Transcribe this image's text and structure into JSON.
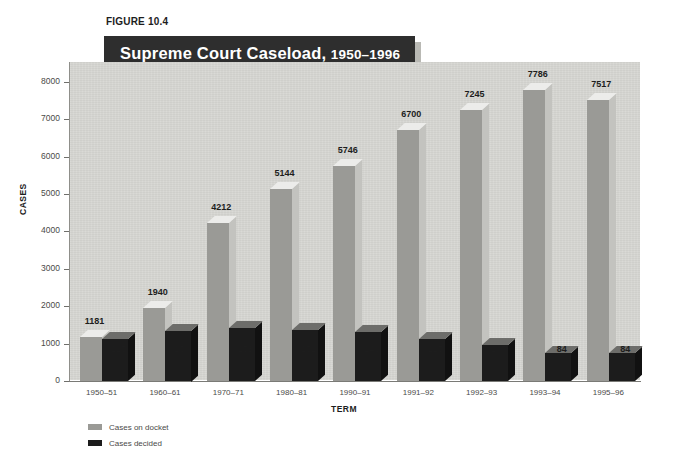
{
  "figure": {
    "label": "FIGURE 10.4",
    "title_main": "Supreme Court Caseload,",
    "title_years": "1950–1996"
  },
  "legend": {
    "position": "bottom-left",
    "items": [
      {
        "label": "Cases on docket",
        "color": "#9a9a96",
        "key": "docket"
      },
      {
        "label": "Cases decided",
        "color": "#1c1c1c",
        "key": "decided"
      }
    ]
  },
  "chart_data": {
    "type": "bar",
    "title": "Supreme Court Caseload, 1950–1996",
    "xlabel": "TERM",
    "ylabel": "CASES",
    "ylim": [
      0,
      8500
    ],
    "yticks": [
      0,
      1000,
      2000,
      3000,
      4000,
      5000,
      6000,
      7000,
      8000
    ],
    "ytick_labels": [
      "0",
      "1000",
      "2000",
      "3000",
      "4000",
      "5000",
      "6000",
      "7000",
      "8000"
    ],
    "grid": false,
    "categories": [
      "1950–51",
      "1960–61",
      "1970–71",
      "1980–81",
      "1990–91",
      "1991–92",
      "1992–93",
      "1993–94",
      "1995–96"
    ],
    "series": [
      {
        "name": "Cases on docket",
        "color": "#9a9a96",
        "values": [
          1181,
          1940,
          4212,
          5144,
          5746,
          6700,
          7245,
          7786,
          7517
        ],
        "labels": [
          "1181",
          "1940",
          "4212",
          "5144",
          "5746",
          "6700",
          "7245",
          "7786",
          "7517"
        ]
      },
      {
        "name": "Cases decided",
        "color": "#1c1c1c",
        "values": [
          125,
          150,
          158,
          152,
          146,
          125,
          107,
          84,
          84
        ],
        "labels": [
          "125",
          "150",
          "158",
          "152",
          "146",
          "125",
          "107",
          "84",
          "84"
        ]
      }
    ]
  }
}
